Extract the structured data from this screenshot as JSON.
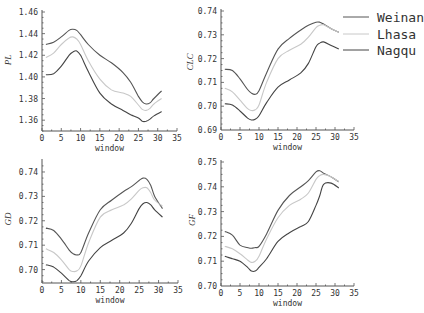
{
  "chart_data": [
    {
      "type": "line",
      "title": "",
      "xlabel": "window",
      "ylabel": "PL",
      "xlim": [
        0,
        35
      ],
      "ylim": [
        1.35,
        1.46
      ],
      "xticks": [
        0,
        5,
        10,
        15,
        20,
        25,
        30,
        35
      ],
      "yticks": [
        1.36,
        1.38,
        1.4,
        1.42,
        1.44,
        1.46
      ],
      "ytick_labels": [
        "1.36",
        "1.38",
        "1.40",
        "1.42",
        "1.44",
        "1.46"
      ],
      "grid": false,
      "x": [
        1,
        3,
        5,
        7,
        8,
        9,
        10,
        12,
        15,
        18,
        21,
        23,
        25,
        26,
        27,
        28,
        29,
        31
      ],
      "series": [
        {
          "name": "Weinan",
          "values": [
            1.43,
            1.432,
            1.437,
            1.443,
            1.444,
            1.443,
            1.439,
            1.43,
            1.42,
            1.413,
            1.404,
            1.395,
            1.382,
            1.377,
            1.375,
            1.376,
            1.38,
            1.387
          ]
        },
        {
          "name": "Lhasa",
          "values": [
            1.418,
            1.422,
            1.43,
            1.436,
            1.437,
            1.435,
            1.43,
            1.415,
            1.398,
            1.388,
            1.385,
            1.382,
            1.374,
            1.37,
            1.369,
            1.371,
            1.375,
            1.38
          ]
        },
        {
          "name": "Nagqu",
          "values": [
            1.402,
            1.403,
            1.41,
            1.42,
            1.423,
            1.424,
            1.42,
            1.405,
            1.385,
            1.375,
            1.369,
            1.365,
            1.362,
            1.359,
            1.359,
            1.361,
            1.364,
            1.368
          ]
        }
      ]
    },
    {
      "type": "line",
      "title": "",
      "xlabel": "window",
      "ylabel": "CLC",
      "xlim": [
        0,
        35
      ],
      "ylim": [
        0.69,
        0.74
      ],
      "xticks": [
        0,
        5,
        10,
        15,
        20,
        25,
        30,
        35
      ],
      "yticks": [
        0.69,
        0.7,
        0.71,
        0.72,
        0.73,
        0.74
      ],
      "ytick_labels": [
        "0.69",
        "0.70",
        "0.71",
        "0.72",
        "0.73",
        "0.74"
      ],
      "grid": false,
      "x": [
        1,
        3,
        5,
        7,
        8,
        9,
        10,
        12,
        15,
        18,
        21,
        23,
        25,
        26,
        27,
        29,
        31
      ],
      "series": [
        {
          "name": "Weinan",
          "values": [
            0.7155,
            0.715,
            0.7115,
            0.707,
            0.7055,
            0.705,
            0.7065,
            0.714,
            0.724,
            0.7285,
            0.732,
            0.734,
            0.7353,
            0.7353,
            0.7345,
            0.7325,
            0.731
          ]
        },
        {
          "name": "Lhasa",
          "values": [
            0.7075,
            0.706,
            0.7025,
            0.699,
            0.6982,
            0.6985,
            0.7005,
            0.71,
            0.72,
            0.7235,
            0.726,
            0.729,
            0.733,
            0.734,
            0.7342,
            0.7325,
            0.731
          ]
        },
        {
          "name": "Nagqu",
          "values": [
            0.701,
            0.7005,
            0.698,
            0.695,
            0.6942,
            0.6945,
            0.696,
            0.7015,
            0.708,
            0.711,
            0.714,
            0.718,
            0.725,
            0.7265,
            0.727,
            0.7255,
            0.724
          ]
        }
      ]
    },
    {
      "type": "line",
      "title": "",
      "xlabel": "window",
      "ylabel": "GD",
      "xlim": [
        0,
        35
      ],
      "ylim": [
        0.694,
        0.744
      ],
      "xticks": [
        0,
        5,
        10,
        15,
        20,
        25,
        30,
        35
      ],
      "yticks": [
        0.7,
        0.71,
        0.72,
        0.73,
        0.74
      ],
      "ytick_labels": [
        "0.70",
        "0.71",
        "0.72",
        "0.73",
        "0.74"
      ],
      "grid": false,
      "x": [
        1,
        3,
        5,
        7,
        8,
        9,
        10,
        12,
        15,
        18,
        21,
        23,
        25,
        26,
        27,
        28,
        29,
        31
      ],
      "series": [
        {
          "name": "Weinan",
          "values": [
            0.717,
            0.716,
            0.7125,
            0.708,
            0.7065,
            0.706,
            0.707,
            0.715,
            0.7245,
            0.7285,
            0.732,
            0.734,
            0.7365,
            0.7375,
            0.737,
            0.7345,
            0.73,
            0.725
          ]
        },
        {
          "name": "Lhasa",
          "values": [
            0.7085,
            0.707,
            0.704,
            0.7,
            0.6992,
            0.6995,
            0.7015,
            0.711,
            0.7215,
            0.7245,
            0.7265,
            0.729,
            0.7325,
            0.7335,
            0.7335,
            0.7315,
            0.7285,
            0.726
          ]
        },
        {
          "name": "Nagqu",
          "values": [
            0.702,
            0.701,
            0.6985,
            0.6955,
            0.695,
            0.6955,
            0.6975,
            0.7035,
            0.709,
            0.712,
            0.715,
            0.719,
            0.725,
            0.727,
            0.7275,
            0.7265,
            0.7245,
            0.7215
          ]
        }
      ]
    },
    {
      "type": "line",
      "title": "",
      "xlabel": "window",
      "ylabel": "GF",
      "xlim": [
        0,
        35
      ],
      "ylim": [
        0.7,
        0.75
      ],
      "xticks": [
        0,
        5,
        10,
        15,
        20,
        25,
        30,
        35
      ],
      "yticks": [
        0.7,
        0.71,
        0.72,
        0.73,
        0.74,
        0.75
      ],
      "ytick_labels": [
        "0.70",
        "0.71",
        "0.72",
        "0.73",
        "0.74",
        "0.75"
      ],
      "grid": false,
      "x": [
        1,
        3,
        5,
        7,
        8,
        9,
        10,
        12,
        15,
        18,
        21,
        23,
        25,
        26,
        27,
        29,
        31
      ],
      "series": [
        {
          "name": "Weinan",
          "values": [
            0.722,
            0.7205,
            0.7165,
            0.7155,
            0.7152,
            0.7155,
            0.716,
            0.721,
            0.7305,
            0.7365,
            0.74,
            0.7425,
            0.746,
            0.7465,
            0.7455,
            0.744,
            0.742
          ]
        },
        {
          "name": "Lhasa",
          "values": [
            0.716,
            0.715,
            0.713,
            0.7105,
            0.7095,
            0.71,
            0.712,
            0.719,
            0.7275,
            0.7325,
            0.735,
            0.7375,
            0.743,
            0.7445,
            0.745,
            0.744,
            0.742
          ]
        },
        {
          "name": "Nagqu",
          "values": [
            0.712,
            0.711,
            0.71,
            0.7075,
            0.706,
            0.706,
            0.7075,
            0.711,
            0.718,
            0.7215,
            0.724,
            0.726,
            0.7325,
            0.7365,
            0.741,
            0.7415,
            0.7395
          ]
        }
      ]
    }
  ],
  "legend": {
    "entries": [
      {
        "label": "Weinan",
        "color": "#555555"
      },
      {
        "label": "Lhasa",
        "color": "#c8c8c8"
      },
      {
        "label": "Nagqu",
        "color": "#444444"
      }
    ]
  },
  "colors": {
    "Weinan": "#555555",
    "Lhasa": "#c8c8c8",
    "Nagqu": "#444444",
    "axis": "#555555"
  },
  "layout": {
    "panels": [
      {
        "x0": 42,
        "x1": 177,
        "yTop": 12,
        "yBottom": 131,
        "vTop": 1.46,
        "vBottom": 1.35,
        "ylabelX": 11,
        "ylabelY": 60
      },
      {
        "x0": 221,
        "x1": 354,
        "yTop": 11,
        "yBottom": 130,
        "vTop": 0.74,
        "vBottom": 0.69,
        "ylabelX": 193,
        "ylabelY": 62
      },
      {
        "x0": 42,
        "x1": 178,
        "yTop": 161,
        "yBottom": 283,
        "vTop": 0.7445,
        "vBottom": 0.6945,
        "ylabelX": 11,
        "ylabelY": 219
      },
      {
        "x0": 221,
        "x1": 354,
        "yTop": 162,
        "yBottom": 286,
        "vTop": 0.75,
        "vBottom": 0.7,
        "ylabelX": 195,
        "ylabelY": 220
      }
    ]
  }
}
